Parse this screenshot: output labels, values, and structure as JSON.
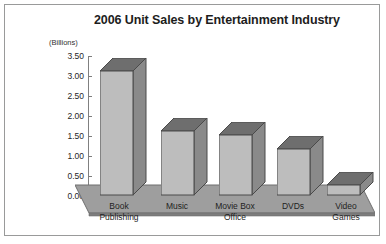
{
  "chart_data": {
    "type": "bar",
    "title": "2006 Unit Sales by Entertainment Industry",
    "xlabel": "",
    "ylabel": "(Billions)",
    "ylim": [
      0,
      3.5
    ],
    "grid": false,
    "legend": "none",
    "categories": [
      "Book Publishing",
      "Music",
      "Movie Box Office",
      "DVDs",
      "Video Games"
    ],
    "values": [
      3.1,
      1.6,
      1.5,
      1.15,
      0.25
    ],
    "ytick_labels": [
      "3.50",
      "3.00",
      "2.50",
      "2.00",
      "1.50",
      "1.00",
      "0.50",
      "0.00"
    ],
    "ytick_values": [
      3.5,
      3.0,
      2.5,
      2.0,
      1.5,
      1.0,
      0.5,
      0.0
    ]
  },
  "chart": {
    "title": "2006 Unit Sales by Entertainment Industry",
    "unit_label": "(Billions)",
    "y_ticks": [
      {
        "label": "3.50"
      },
      {
        "label": "3.00"
      },
      {
        "label": "2.50"
      },
      {
        "label": "2.00"
      },
      {
        "label": "1.50"
      },
      {
        "label": "1.00"
      },
      {
        "label": "0.50"
      },
      {
        "label": "0.00"
      }
    ],
    "categories": [
      {
        "line1": "Book",
        "line2": "Publishing"
      },
      {
        "line1": "Music",
        "line2": ""
      },
      {
        "line1": "Movie Box",
        "line2": "Office"
      },
      {
        "line1": "DVDs",
        "line2": ""
      },
      {
        "line1": "Video",
        "line2": "Games"
      }
    ],
    "colors": {
      "bar_front": "#bdbdbd",
      "bar_top": "#6e6e6e",
      "bar_side": "#8a8a8a",
      "bar_outline": "#4a4a4a",
      "floor_top": "#9a9a9a",
      "floor_edge": "#6f6f6f",
      "axis": "#808080",
      "border": "#999a9a",
      "text": "#1d1d1d",
      "background": "#ffffff"
    }
  }
}
